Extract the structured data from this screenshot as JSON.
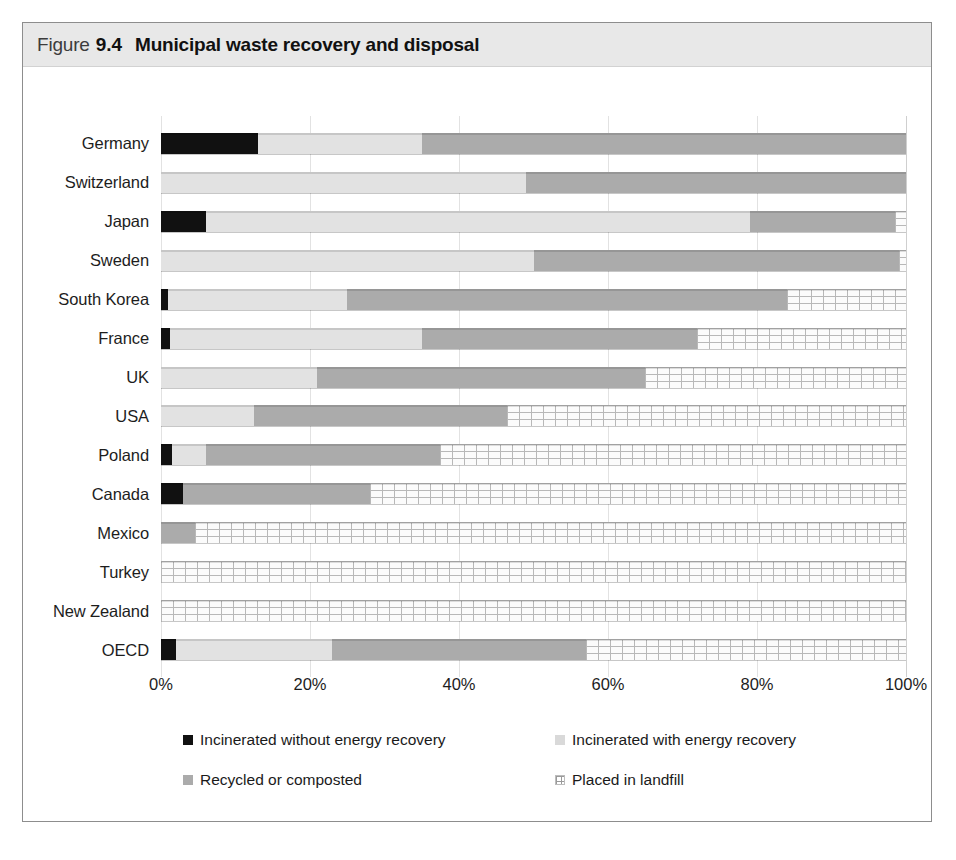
{
  "figure": {
    "label": "Figure",
    "number": "9.4",
    "title": "Municipal waste recovery and disposal"
  },
  "colors": {
    "incinerated_without_energy_recovery": "#111111",
    "incinerated_with_energy_recovery": "#e2e2e2",
    "recycled_or_composted": "#ababab",
    "placed_in_landfill": "#fbfbfb",
    "landfill_hatch": "#b8b8b8",
    "title_band": "#e8e8e8",
    "frame_border": "#8d8d8d",
    "gridline": "#e2e2e2"
  },
  "legend": {
    "position": "bottom",
    "items": [
      {
        "label": "Incinerated without energy recovery",
        "swatch": "inc-noenergy"
      },
      {
        "label": "Incinerated with energy recovery",
        "swatch": "inc-energy"
      },
      {
        "label": "Recycled or composted",
        "swatch": "recycled"
      },
      {
        "label": "Placed in landfill",
        "swatch": "landfill"
      }
    ]
  },
  "chart_data": {
    "type": "bar",
    "orientation": "horizontal",
    "stacked": true,
    "normalized": true,
    "title": "Municipal waste recovery and disposal",
    "xlabel": "",
    "ylabel": "",
    "xlim": [
      0,
      100
    ],
    "grid": true,
    "xticks": [
      "0%",
      "20%",
      "40%",
      "60%",
      "80%",
      "100%"
    ],
    "xtick_values": [
      0,
      20,
      40,
      60,
      80,
      100
    ],
    "categories": [
      "Germany",
      "Switzerland",
      "Japan",
      "Sweden",
      "South Korea",
      "France",
      "UK",
      "USA",
      "Poland",
      "Canada",
      "Mexico",
      "Turkey",
      "New Zealand",
      "OECD"
    ],
    "series": [
      {
        "name": "Incinerated without energy recovery",
        "key": "inc-noenergy",
        "values": [
          13.0,
          0.0,
          6.0,
          0.0,
          1.0,
          1.2,
          0.0,
          0.0,
          1.5,
          3.0,
          0.0,
          0.0,
          0.0,
          2.0
        ]
      },
      {
        "name": "Incinerated with energy recovery",
        "key": "inc-energy",
        "values": [
          22.0,
          49.0,
          73.0,
          50.0,
          24.0,
          33.8,
          21.0,
          12.5,
          4.5,
          0.0,
          0.0,
          0.0,
          0.0,
          21.0
        ]
      },
      {
        "name": "Recycled or composted",
        "key": "recycled",
        "values": [
          65.0,
          51.0,
          19.5,
          49.0,
          59.0,
          37.0,
          44.0,
          34.0,
          31.5,
          25.0,
          4.5,
          0.0,
          0.0,
          34.0
        ]
      },
      {
        "name": "Placed in landfill",
        "key": "landfill",
        "values": [
          0.0,
          0.0,
          1.5,
          1.0,
          16.0,
          28.0,
          35.0,
          53.5,
          62.5,
          72.0,
          95.5,
          100.0,
          100.0,
          43.0
        ]
      }
    ]
  }
}
